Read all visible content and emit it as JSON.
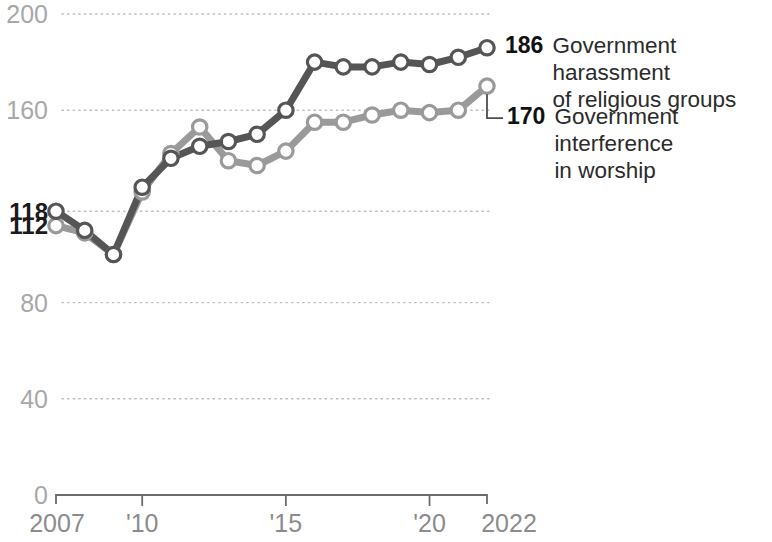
{
  "chart_data": {
    "type": "line",
    "title": "",
    "subtitle": "",
    "xlabel": "",
    "ylabel": "",
    "xlim": [
      2007,
      2022
    ],
    "ylim": [
      0,
      200
    ],
    "grid": true,
    "legend_position": "right-inline-end-labels",
    "x": [
      2007,
      2008,
      2009,
      2010,
      2011,
      2012,
      2013,
      2014,
      2015,
      2016,
      2017,
      2018,
      2019,
      2020,
      2021,
      2022
    ],
    "yticks": [
      0,
      40,
      80,
      160,
      200
    ],
    "ytick_labels": [
      "0",
      "40",
      "80",
      "160",
      "200"
    ],
    "emphasis_yticks": [
      118,
      112
    ],
    "emphasis_ytick_labels": [
      "118",
      "112"
    ],
    "xticks": [
      2007,
      2010,
      2015,
      2020,
      2022
    ],
    "xtick_labels": [
      "2007",
      "'10",
      "'15",
      "'20",
      "2022"
    ],
    "series": [
      {
        "name": "Government harassment of religious groups",
        "color": "#555555",
        "end_value": 186,
        "end_label": "186",
        "label_line1": "Government harassment",
        "label_line2": "of religious groups",
        "values": [
          118,
          110,
          100,
          128,
          140,
          145,
          147,
          150,
          160,
          180,
          178,
          178,
          180,
          179,
          182,
          186
        ]
      },
      {
        "name": "Government interference in worship",
        "color": "#9a9a9a",
        "end_value": 170,
        "end_label": "170",
        "label_line1": "Government interference",
        "label_line2": "in worship",
        "values": [
          112,
          109,
          100,
          126,
          142,
          153,
          139,
          137,
          143,
          155,
          155,
          158,
          160,
          159,
          160,
          170
        ]
      }
    ]
  },
  "legend": {
    "items": [
      {
        "value": "186",
        "text": "Government harassment\nof religious groups",
        "color": "#555555"
      },
      {
        "value": "170",
        "text": "Government interference\nin worship",
        "color": "#9a9a9a"
      }
    ]
  }
}
